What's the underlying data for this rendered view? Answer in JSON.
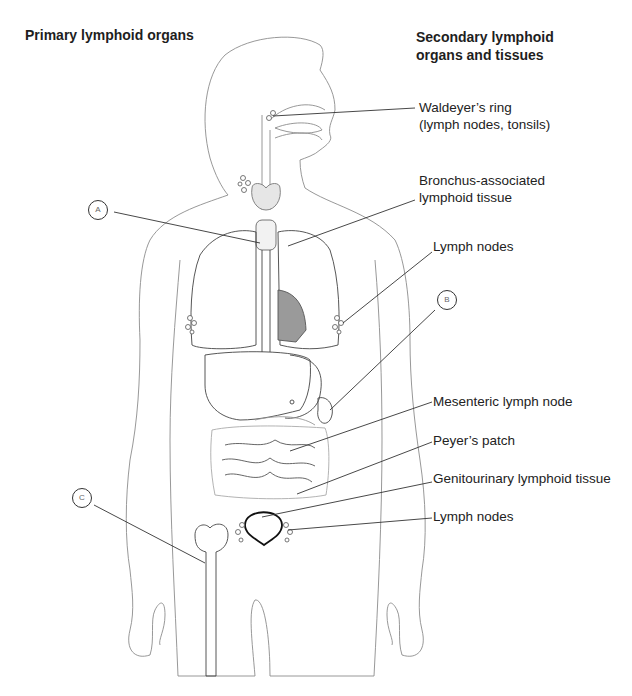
{
  "figure": {
    "headings": {
      "primary": "Primary lymphoid organs",
      "secondary_line1": "Secondary lymphoid",
      "secondary_line2": "organs and tissues"
    },
    "markers": [
      {
        "id": "A",
        "label": "A"
      },
      {
        "id": "B",
        "label": "B"
      },
      {
        "id": "C",
        "label": "C"
      }
    ],
    "secondary_labels": [
      {
        "line1": "Waldeyer’s ring",
        "line2": "(lymph nodes, tonsils)"
      },
      {
        "line1": "Bronchus-associated",
        "line2": "lymphoid tissue"
      },
      {
        "line1": "Lymph nodes"
      },
      {
        "line1": "Mesenteric lymph node"
      },
      {
        "line1": "Peyer’s patch"
      },
      {
        "line1": "Genitourinary lymphoid tissue"
      },
      {
        "line1": "Lymph nodes"
      }
    ],
    "colors": {
      "outline": "#8a8a8a",
      "organ_outline": "#444444",
      "leader": "#333333",
      "heart_fill": "#9a9a9a",
      "thymus_fill": "#e6e6e6"
    }
  }
}
